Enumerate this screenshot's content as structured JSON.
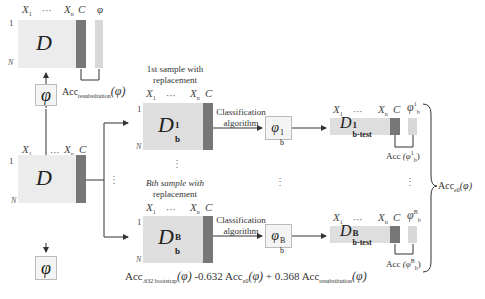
{
  "diagram": {
    "original_dataset": {
      "symbol": "D",
      "col_first": "X",
      "col_first_sub": "1",
      "col_ellipsis": "···",
      "col_last": "X",
      "col_last_sub": "n",
      "class_col": "C",
      "row_first": "1",
      "row_last": "N",
      "phi_col": "φ"
    },
    "resubstitution": {
      "label": "Acc",
      "sub": "resubstitution",
      "arg": "(φ)"
    },
    "phi_top": "φ",
    "phi_bottom": "φ",
    "samples": [
      {
        "title_line1": "1st sample with",
        "title_line2": "replacement",
        "dataset_symbol": "D",
        "dataset_sup": "1",
        "dataset_sub": "b",
        "algo_line1": "Classification",
        "algo_line2": "algorithm",
        "model_symbol": "φ",
        "model_sup": "1",
        "model_sub": "b",
        "test_symbol": "D",
        "test_sup": "1",
        "test_sub": "b-test",
        "acc_label": "Acc",
        "acc_arg": "(φ",
        "acc_sup": "1",
        "acc_sub": "b",
        "acc_close": ")"
      },
      {
        "title_line1": "Bth sample with",
        "title_line2": "replacement",
        "dataset_symbol": "D",
        "dataset_sup": "B",
        "dataset_sub": "b",
        "algo_line1": "Classification",
        "algo_line2": "algorithm",
        "model_symbol": "φ",
        "model_sup": "B",
        "model_sub": "b",
        "test_symbol": "D",
        "test_sup": "B",
        "test_sub": "b-test",
        "acc_label": "Acc",
        "acc_arg": "(φ",
        "acc_sup": "B",
        "acc_sub": "b",
        "acc_close": ")"
      }
    ],
    "acc_e0": {
      "label": "Acc",
      "sub": "e0",
      "arg": "(φ)"
    },
    "formula": {
      "lhs": "Acc",
      "lhs_sub": ".632 bootstrap",
      "lhs_arg": "(φ)",
      "t1": " -0.632 Acc",
      "t1_sub": "e0",
      "t1_arg": "(φ)",
      "t2": " + 0.368 Acc",
      "t2_sub": "resubstitution",
      "t2_arg": "(φ)"
    },
    "ellipsis_v": "⋮"
  }
}
